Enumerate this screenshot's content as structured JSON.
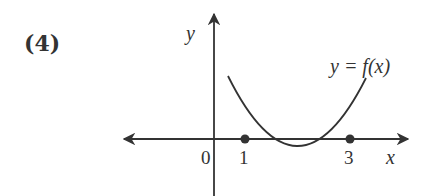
{
  "problem": {
    "number_label": "(4)"
  },
  "axes": {
    "x_label": "x",
    "y_label": "y",
    "origin_label": "0",
    "ticks": [
      "1",
      "3"
    ]
  },
  "curve": {
    "label": "y = f(x)",
    "type": "parabola",
    "roots": [
      1,
      3
    ],
    "opens": "up"
  },
  "colors": {
    "ink": "#333333",
    "background": "#ffffff"
  }
}
